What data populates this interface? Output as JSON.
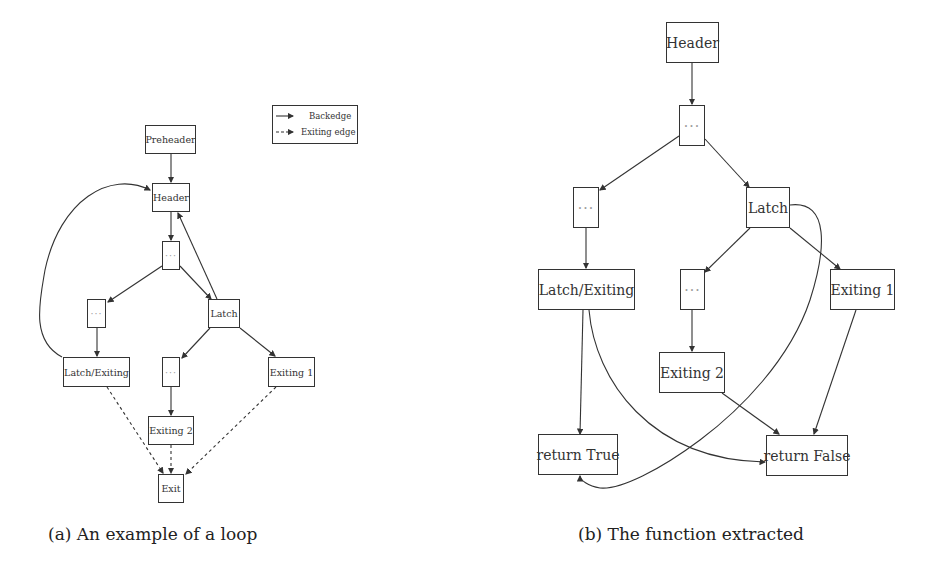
{
  "figure_a": {
    "caption": "(a) An example of a loop",
    "legend": {
      "backedge_label": "Backedge",
      "exiting_label": "Exiting edge"
    },
    "nodes": {
      "preheader": "Preheader",
      "header": "Header",
      "block1": "···",
      "block_left": "···",
      "latch": "Latch",
      "latch_exiting": "Latch/Exiting",
      "block_mid": "···",
      "exiting1": "Exiting 1",
      "exiting2": "Exiting 2",
      "exit": "Exit"
    },
    "edges": [
      {
        "from": "preheader",
        "to": "header",
        "style": "solid"
      },
      {
        "from": "header",
        "to": "block1",
        "style": "solid"
      },
      {
        "from": "block1",
        "to": "block_left",
        "style": "solid"
      },
      {
        "from": "block1",
        "to": "latch",
        "style": "solid"
      },
      {
        "from": "latch",
        "to": "header",
        "style": "solid",
        "kind": "backedge"
      },
      {
        "from": "latch_exiting",
        "to": "header",
        "style": "solid",
        "kind": "backedge"
      },
      {
        "from": "block_left",
        "to": "latch_exiting",
        "style": "solid"
      },
      {
        "from": "latch",
        "to": "block_mid",
        "style": "solid"
      },
      {
        "from": "latch",
        "to": "exiting1",
        "style": "solid"
      },
      {
        "from": "block_mid",
        "to": "exiting2",
        "style": "solid"
      },
      {
        "from": "latch_exiting",
        "to": "exit",
        "style": "dashed"
      },
      {
        "from": "exiting2",
        "to": "exit",
        "style": "dashed"
      },
      {
        "from": "exiting1",
        "to": "exit",
        "style": "dashed"
      }
    ]
  },
  "figure_b": {
    "caption": "(b) The function extracted",
    "nodes": {
      "header": "Header",
      "block1": "···",
      "block_left": "···",
      "latch": "Latch",
      "latch_exiting": "Latch/Exiting",
      "block_mid": "···",
      "exiting1": "Exiting 1",
      "exiting2": "Exiting 2",
      "return_true": "return True",
      "return_false": "return False"
    },
    "edges": [
      {
        "from": "header",
        "to": "block1"
      },
      {
        "from": "block1",
        "to": "block_left"
      },
      {
        "from": "block1",
        "to": "latch"
      },
      {
        "from": "block_left",
        "to": "latch_exiting"
      },
      {
        "from": "latch",
        "to": "block_mid"
      },
      {
        "from": "latch",
        "to": "exiting1"
      },
      {
        "from": "latch",
        "to": "return_true"
      },
      {
        "from": "block_mid",
        "to": "exiting2"
      },
      {
        "from": "latch_exiting",
        "to": "return_true"
      },
      {
        "from": "latch_exiting",
        "to": "return_false"
      },
      {
        "from": "exiting2",
        "to": "return_false"
      },
      {
        "from": "exiting1",
        "to": "return_false"
      }
    ]
  }
}
